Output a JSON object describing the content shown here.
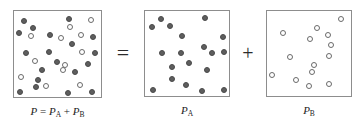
{
  "figure": {
    "colors": {
      "filled_particle": "#5e5e5e",
      "open_particle": "#ffffff",
      "particle_outline": "#6a6a6a",
      "box_border": "#8d8d8d",
      "background": "#ffffff",
      "text": "#1d1d1d"
    },
    "operators": {
      "equals": "=",
      "plus": "+"
    },
    "boxes": [
      {
        "id": "mixture-box",
        "label_parts": {
          "p": "P",
          "equals": " = ",
          "pa": "P",
          "pa_sub": "A",
          "plus": " + ",
          "pb": "P",
          "pb_sub": "B"
        },
        "label_text": "P = PA + PB",
        "rect": {
          "x": 13,
          "y": 10,
          "w": 89,
          "h": 88
        },
        "filled_count": 18,
        "open_count": 12,
        "particles": [
          {
            "type": "filled",
            "cx": 24,
            "cy": 21,
            "r": 3.4
          },
          {
            "type": "filled",
            "cx": 69,
            "cy": 19,
            "r": 3.4
          },
          {
            "type": "open",
            "cx": 91,
            "cy": 20,
            "r": 3.4
          },
          {
            "type": "filled",
            "cx": 33,
            "cy": 28,
            "r": 3.4
          },
          {
            "type": "open",
            "cx": 70,
            "cy": 27,
            "r": 3.4
          },
          {
            "type": "filled",
            "cx": 19,
            "cy": 33,
            "r": 3.4
          },
          {
            "type": "open",
            "cx": 31,
            "cy": 36,
            "r": 3.4
          },
          {
            "type": "filled",
            "cx": 50,
            "cy": 35,
            "r": 3.4
          },
          {
            "type": "open",
            "cx": 61,
            "cy": 38,
            "r": 3.4
          },
          {
            "type": "open",
            "cx": 81,
            "cy": 35,
            "r": 3.4
          },
          {
            "type": "filled",
            "cx": 93,
            "cy": 37,
            "r": 3.4
          },
          {
            "type": "filled",
            "cx": 72,
            "cy": 44,
            "r": 3.4
          },
          {
            "type": "filled",
            "cx": 26,
            "cy": 53,
            "r": 3.4
          },
          {
            "type": "filled",
            "cx": 49,
            "cy": 52,
            "r": 3.4
          },
          {
            "type": "open",
            "cx": 82,
            "cy": 52,
            "r": 3.4
          },
          {
            "type": "filled",
            "cx": 95,
            "cy": 53,
            "r": 3.4
          },
          {
            "type": "open",
            "cx": 35,
            "cy": 61,
            "r": 3.4
          },
          {
            "type": "filled",
            "cx": 57,
            "cy": 62,
            "r": 3.4
          },
          {
            "type": "open",
            "cx": 65,
            "cy": 65,
            "r": 3.4
          },
          {
            "type": "filled",
            "cx": 88,
            "cy": 64,
            "r": 3.4
          },
          {
            "type": "filled",
            "cx": 42,
            "cy": 70,
            "r": 3.4
          },
          {
            "type": "open",
            "cx": 63,
            "cy": 70,
            "r": 3.4
          },
          {
            "type": "filled",
            "cx": 75,
            "cy": 72,
            "r": 3.4
          },
          {
            "type": "open",
            "cx": 21,
            "cy": 77,
            "r": 3.4
          },
          {
            "type": "filled",
            "cx": 38,
            "cy": 80,
            "r": 3.4
          },
          {
            "type": "filled",
            "cx": 36,
            "cy": 87,
            "r": 3.4
          },
          {
            "type": "open",
            "cx": 46,
            "cy": 86,
            "r": 3.4
          },
          {
            "type": "open",
            "cx": 80,
            "cy": 85,
            "r": 3.4
          },
          {
            "type": "filled",
            "cx": 20,
            "cy": 92,
            "r": 3.4
          },
          {
            "type": "filled",
            "cx": 68,
            "cy": 93,
            "r": 3.4
          },
          {
            "type": "filled",
            "cx": 92,
            "cy": 92,
            "r": 3.4
          }
        ]
      },
      {
        "id": "gas-a-box",
        "label_parts": {
          "p": "P",
          "sub": "A"
        },
        "label_text": "PA",
        "rect": {
          "x": 144,
          "y": 10,
          "w": 86,
          "h": 87
        },
        "filled_count": 18,
        "open_count": 0,
        "particles": [
          {
            "type": "filled",
            "cx": 161,
            "cy": 19,
            "r": 3.4
          },
          {
            "type": "filled",
            "cx": 205,
            "cy": 18,
            "r": 3.4
          },
          {
            "type": "filled",
            "cx": 152,
            "cy": 27,
            "r": 3.4
          },
          {
            "type": "filled",
            "cx": 170,
            "cy": 26,
            "r": 3.4
          },
          {
            "type": "filled",
            "cx": 182,
            "cy": 36,
            "r": 3.4
          },
          {
            "type": "filled",
            "cx": 223,
            "cy": 37,
            "r": 3.4
          },
          {
            "type": "filled",
            "cx": 204,
            "cy": 47,
            "r": 3.4
          },
          {
            "type": "filled",
            "cx": 162,
            "cy": 53,
            "r": 3.4
          },
          {
            "type": "filled",
            "cx": 181,
            "cy": 53,
            "r": 3.4
          },
          {
            "type": "filled",
            "cx": 212,
            "cy": 53,
            "r": 3.4
          },
          {
            "type": "filled",
            "cx": 224,
            "cy": 52,
            "r": 3.4
          },
          {
            "type": "filled",
            "cx": 189,
            "cy": 63,
            "r": 3.4
          },
          {
            "type": "filled",
            "cx": 172,
            "cy": 67,
            "r": 3.4
          },
          {
            "type": "filled",
            "cx": 207,
            "cy": 70,
            "r": 3.4
          },
          {
            "type": "filled",
            "cx": 172,
            "cy": 79,
            "r": 3.4
          },
          {
            "type": "filled",
            "cx": 186,
            "cy": 85,
            "r": 3.4
          },
          {
            "type": "filled",
            "cx": 153,
            "cy": 90,
            "r": 3.4
          },
          {
            "type": "filled",
            "cx": 202,
            "cy": 91,
            "r": 3.4
          },
          {
            "type": "filled",
            "cx": 224,
            "cy": 90,
            "r": 3.4
          }
        ]
      },
      {
        "id": "gas-b-box",
        "label_parts": {
          "p": "P",
          "sub": "B"
        },
        "label_text": "PB",
        "rect": {
          "x": 266,
          "y": 10,
          "w": 86,
          "h": 87
        },
        "filled_count": 0,
        "open_count": 12,
        "particles": [
          {
            "type": "open",
            "cx": 341,
            "cy": 19,
            "r": 3.4
          },
          {
            "type": "open",
            "cx": 317,
            "cy": 28,
            "r": 3.4
          },
          {
            "type": "open",
            "cx": 283,
            "cy": 33,
            "r": 3.4
          },
          {
            "type": "open",
            "cx": 328,
            "cy": 35,
            "r": 3.4
          },
          {
            "type": "open",
            "cx": 310,
            "cy": 39,
            "r": 3.4
          },
          {
            "type": "open",
            "cx": 331,
            "cy": 45,
            "r": 3.4
          },
          {
            "type": "open",
            "cx": 290,
            "cy": 57,
            "r": 3.4
          },
          {
            "type": "open",
            "cx": 329,
            "cy": 56,
            "r": 3.4
          },
          {
            "type": "open",
            "cx": 314,
            "cy": 65,
            "r": 3.4
          },
          {
            "type": "open",
            "cx": 312,
            "cy": 72,
            "r": 3.4
          },
          {
            "type": "open",
            "cx": 272,
            "cy": 75,
            "r": 3.4
          },
          {
            "type": "open",
            "cx": 296,
            "cy": 80,
            "r": 3.4
          },
          {
            "type": "open",
            "cx": 329,
            "cy": 84,
            "r": 3.4
          },
          {
            "type": "open",
            "cx": 309,
            "cy": 86,
            "r": 3.4
          }
        ]
      }
    ]
  }
}
